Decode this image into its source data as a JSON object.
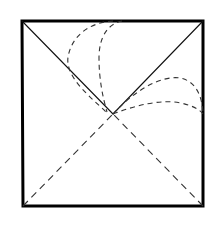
{
  "figure": {
    "canvas": {
      "width": 213,
      "height": 230,
      "background": "#ffffff"
    },
    "colors": {
      "stroke_solid": "#111111",
      "stroke_border": "#000000",
      "stroke_dashed": "#333333",
      "background": "#ffffff"
    },
    "square": {
      "label": "outer-square",
      "corner_top_left": [
        22,
        21
      ],
      "corner_top_right": [
        203,
        21
      ],
      "corner_bottom_right": [
        203,
        206
      ],
      "corner_bottom_left": [
        23,
        206
      ],
      "stroke_width": 3.0,
      "style": "solid"
    },
    "center_point": [
      113,
      114
    ],
    "diagonals": [
      {
        "label": "diagonal-top-left-to-center",
        "from": [
          22,
          21
        ],
        "to": [
          113,
          114
        ],
        "style": "solid",
        "stroke_width": 1.1
      },
      {
        "label": "diagonal-top-right-to-center",
        "from": [
          203,
          21
        ],
        "to": [
          113,
          114
        ],
        "style": "solid",
        "stroke_width": 1.1
      },
      {
        "label": "diagonal-bottom-left-to-center",
        "from": [
          23,
          206
        ],
        "to": [
          113,
          114
        ],
        "style": "dashed",
        "stroke_width": 1.1,
        "dash_pattern": "7 5"
      },
      {
        "label": "diagonal-bottom-right-to-center",
        "from": [
          203,
          206
        ],
        "to": [
          113,
          114
        ],
        "style": "dashed",
        "stroke_width": 1.1,
        "dash_pattern": "7 5"
      }
    ],
    "arcs": [
      {
        "label": "arc-upper-left-outer",
        "path": "M 113 21 C 92 22 72 34 68 57 C 65 78 92 98 106 112",
        "style": "dashed",
        "stroke_width": 1.1,
        "dash_pattern": "5 4",
        "from_description": "top edge near x=113",
        "to_description": "center region near (106,112)"
      },
      {
        "label": "arc-upper-left-inner",
        "path": "M 122 21 C 107 24 99 38 99 58 C 99 80 103 98 107 112",
        "style": "dashed",
        "stroke_width": 1.1,
        "dash_pattern": "5 4",
        "from_description": "top edge near x=122",
        "to_description": "center region near (107,112)"
      },
      {
        "label": "arc-right-upper",
        "path": "M 113 114 C 133 92 160 75 180 78 C 196 81 202 96 203 113",
        "style": "dashed",
        "stroke_width": 1.1,
        "dash_pattern": "5 4",
        "from_description": "center (113,114)",
        "to_description": "right edge near (203,113)"
      },
      {
        "label": "arc-right-lower",
        "path": "M 113 114 C 136 105 162 99 181 103 C 194 106 200 110 203 114",
        "style": "dashed",
        "stroke_width": 1.1,
        "dash_pattern": "5 4",
        "from_description": "center (113,114)",
        "to_description": "right edge near (203,114)"
      }
    ]
  }
}
